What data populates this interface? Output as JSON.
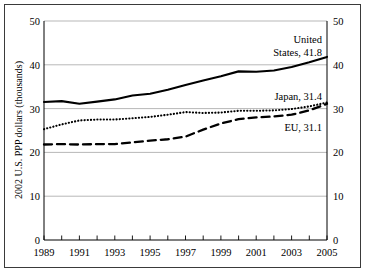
{
  "figure": {
    "frame_color": "#3a3a3a",
    "background": "#ffffff"
  },
  "chart_data": {
    "type": "line",
    "title": "",
    "subtitle": "",
    "xlabel": "",
    "ylabel": "2002 U.S. PPP dollars (thousands)",
    "ylabel_right": "",
    "xlim": [
      1989,
      2005
    ],
    "ylim": [
      0,
      50
    ],
    "y_ticks": [
      0,
      10,
      20,
      30,
      40,
      50
    ],
    "y_tick_labels": [
      "0",
      "10",
      "20",
      "30",
      "40",
      "50"
    ],
    "y_ticks_right": [
      0,
      10,
      20,
      30,
      40,
      50
    ],
    "y_tick_labels_right": [
      "0",
      "10",
      "20",
      "30",
      "40",
      "50"
    ],
    "x": [
      1989,
      1990,
      1991,
      1992,
      1993,
      1994,
      1995,
      1996,
      1997,
      1998,
      1999,
      2000,
      2001,
      2002,
      2003,
      2004,
      2005
    ],
    "x_tick_labels": [
      "1989",
      "",
      "1991",
      "",
      "1993",
      "",
      "1995",
      "",
      "1997",
      "",
      "1999",
      "",
      "2001",
      "",
      "2003",
      "",
      "2005"
    ],
    "x_tick_labels_shown": [
      "1989",
      "1991",
      "1993",
      "1995",
      "1997",
      "1999",
      "2001",
      "2003",
      "2005"
    ],
    "grid": true,
    "grid_axis": "y",
    "grid_color": "#999999",
    "legend": "inline-annotations",
    "legend_position": "right",
    "series": [
      {
        "name": "United States",
        "style": "solid",
        "color": "#000000",
        "annotation": "United States, 41.8",
        "annotation_line_1": "United",
        "annotation_line_2": "States, 41.8",
        "end_value": 41.8,
        "values": [
          31.5,
          31.7,
          31.1,
          31.6,
          32.1,
          33.0,
          33.4,
          34.3,
          35.4,
          36.4,
          37.4,
          38.5,
          38.4,
          38.7,
          39.5,
          40.6,
          41.8
        ]
      },
      {
        "name": "Japan",
        "style": "dotted",
        "color": "#000000",
        "annotation": "Japan, 31.4",
        "end_value": 31.4,
        "values": [
          25.3,
          26.4,
          27.3,
          27.5,
          27.5,
          27.8,
          28.1,
          28.6,
          29.2,
          29.0,
          29.1,
          29.5,
          29.5,
          29.6,
          29.9,
          30.5,
          31.4
        ]
      },
      {
        "name": "EU",
        "style": "dashed",
        "color": "#000000",
        "annotation": "EU, 31.1",
        "end_value": 31.1,
        "values": [
          21.8,
          21.9,
          21.8,
          21.9,
          21.9,
          22.3,
          22.7,
          23.0,
          23.6,
          25.2,
          26.6,
          27.6,
          28.0,
          28.2,
          28.6,
          29.6,
          31.1
        ]
      }
    ]
  }
}
